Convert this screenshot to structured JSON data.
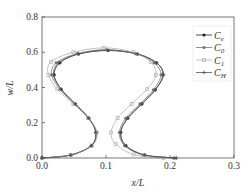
{
  "chart_data": {
    "type": "line",
    "title": "",
    "xlabel": "x/L",
    "ylabel": "w/L",
    "xlim": [
      0.0,
      0.3
    ],
    "ylim": [
      0.0,
      0.8
    ],
    "xticks": [
      "0.0",
      "0.1",
      "0.2",
      "0.3"
    ],
    "yticks": [
      "0.0",
      "0.2",
      "0.4",
      "0.6",
      "0.8"
    ],
    "grid": false,
    "legend_position": "top-right",
    "legend": [
      {
        "base": "C",
        "sub": "e"
      },
      {
        "base": "C",
        "sub": "0"
      },
      {
        "base": "C",
        "sub": "1"
      },
      {
        "base": "C",
        "sub": "H"
      }
    ],
    "series": [
      {
        "name": "Ce",
        "color": "#222222",
        "marker": "circle",
        "points": [
          [
            0.0,
            0.0
          ],
          [
            0.045,
            0.017
          ],
          [
            0.077,
            0.07
          ],
          [
            0.084,
            0.145
          ],
          [
            0.073,
            0.226
          ],
          [
            0.052,
            0.307
          ],
          [
            0.03,
            0.39
          ],
          [
            0.019,
            0.472
          ],
          [
            0.028,
            0.54
          ],
          [
            0.057,
            0.59
          ],
          [
            0.103,
            0.61
          ],
          [
            0.149,
            0.59
          ],
          [
            0.179,
            0.54
          ],
          [
            0.189,
            0.472
          ],
          [
            0.177,
            0.387
          ],
          [
            0.156,
            0.307
          ],
          [
            0.134,
            0.226
          ],
          [
            0.123,
            0.145
          ],
          [
            0.131,
            0.07
          ],
          [
            0.16,
            0.017
          ],
          [
            0.207,
            0.0
          ]
        ]
      },
      {
        "name": "C0",
        "color": "#777777",
        "marker": "circle",
        "points": [
          [
            0.0,
            0.0
          ],
          [
            0.045,
            0.017
          ],
          [
            0.077,
            0.07
          ],
          [
            0.085,
            0.145
          ],
          [
            0.073,
            0.226
          ],
          [
            0.051,
            0.307
          ],
          [
            0.028,
            0.39
          ],
          [
            0.015,
            0.472
          ],
          [
            0.022,
            0.54
          ],
          [
            0.055,
            0.592
          ],
          [
            0.1,
            0.615
          ],
          [
            0.146,
            0.592
          ],
          [
            0.175,
            0.54
          ],
          [
            0.186,
            0.472
          ],
          [
            0.174,
            0.387
          ],
          [
            0.153,
            0.307
          ],
          [
            0.131,
            0.226
          ],
          [
            0.121,
            0.145
          ],
          [
            0.129,
            0.07
          ],
          [
            0.158,
            0.017
          ],
          [
            0.205,
            0.0
          ]
        ]
      },
      {
        "name": "C1",
        "color": "#b0b0b0",
        "marker": "square",
        "points": [
          [
            0.0,
            0.0
          ],
          [
            0.045,
            0.017
          ],
          [
            0.078,
            0.07
          ],
          [
            0.086,
            0.145
          ],
          [
            0.072,
            0.226
          ],
          [
            0.049,
            0.307
          ],
          [
            0.024,
            0.39
          ],
          [
            0.01,
            0.472
          ],
          [
            0.014,
            0.545
          ],
          [
            0.049,
            0.6
          ],
          [
            0.097,
            0.625
          ],
          [
            0.143,
            0.6
          ],
          [
            0.17,
            0.545
          ],
          [
            0.178,
            0.472
          ],
          [
            0.164,
            0.39
          ],
          [
            0.14,
            0.307
          ],
          [
            0.118,
            0.226
          ],
          [
            0.108,
            0.145
          ],
          [
            0.115,
            0.08
          ],
          [
            0.143,
            0.02
          ],
          [
            0.19,
            0.0
          ]
        ]
      },
      {
        "name": "CH",
        "color": "#555555",
        "marker": "star",
        "points": [
          [
            0.0,
            0.0
          ],
          [
            0.045,
            0.017
          ],
          [
            0.077,
            0.07
          ],
          [
            0.084,
            0.145
          ],
          [
            0.073,
            0.226
          ],
          [
            0.052,
            0.307
          ],
          [
            0.03,
            0.39
          ],
          [
            0.018,
            0.472
          ],
          [
            0.026,
            0.54
          ],
          [
            0.057,
            0.59
          ],
          [
            0.103,
            0.612
          ],
          [
            0.149,
            0.59
          ],
          [
            0.179,
            0.54
          ],
          [
            0.19,
            0.472
          ],
          [
            0.177,
            0.387
          ],
          [
            0.156,
            0.307
          ],
          [
            0.134,
            0.226
          ],
          [
            0.123,
            0.145
          ],
          [
            0.131,
            0.07
          ],
          [
            0.161,
            0.017
          ],
          [
            0.21,
            0.0
          ]
        ]
      }
    ]
  }
}
